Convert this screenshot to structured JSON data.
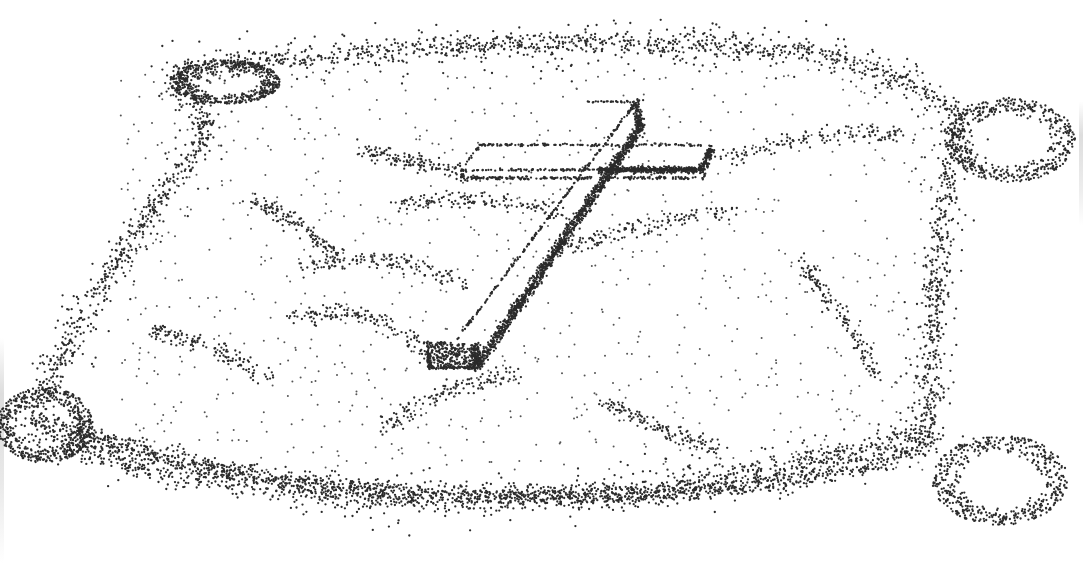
{
  "image": {
    "subject": "Stippled illustration of a cross lying on a pillow",
    "width": 1083,
    "height": 563,
    "background": "#ffffff",
    "ink": "#2b2b2b"
  },
  "pillow": {
    "outline": "M175,75 C300,55 500,40 700,45 C820,48 900,70 960,115 C940,220 930,320 930,430 C760,480 600,500 420,500 C250,495 120,470 30,430 C60,350 120,250 210,130 Z",
    "corners": [
      {
        "name": "top-left-corner",
        "cx": 225,
        "cy": 82,
        "rx": 55,
        "ry": 22
      },
      {
        "name": "top-right-corner",
        "cx": 1010,
        "cy": 140,
        "rx": 65,
        "ry": 42
      },
      {
        "name": "bottom-left-corner",
        "cx": 45,
        "cy": 425,
        "rx": 48,
        "ry": 38
      },
      {
        "name": "bottom-right-corner",
        "cx": 1000,
        "cy": 480,
        "rx": 68,
        "ry": 45
      }
    ]
  },
  "cross": {
    "long_arm_top": [
      612,
      102
    ],
    "long_arm_bottom": [
      428,
      368
    ],
    "cross_bar_left": [
      462,
      178
    ],
    "cross_bar_right": [
      712,
      148
    ],
    "shadow_color": "#222222"
  }
}
